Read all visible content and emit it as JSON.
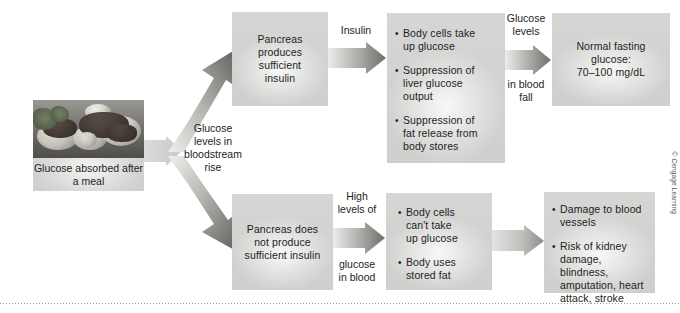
{
  "figure": {
    "credit": "© Cengage Learning",
    "palette": {
      "box_fill": "#d2d2d0",
      "arrow_dark": "#6f6f6d",
      "arrow_light": "#e8e8e6",
      "text": "#1d1d1d",
      "page_background": "#ffffff",
      "rule": "#9a9a98"
    }
  },
  "start": {
    "photo_alt": "plate-of-food-photo",
    "caption": "Glucose absorbed\nafter a meal"
  },
  "connectors": {
    "start_to_branch": {
      "name": "glucose-rise-arrow",
      "label": "Glucose\nlevels in\nbloodstream\nrise"
    },
    "branch_up": {
      "name": "branch-up-arrow",
      "label": ""
    },
    "branch_down": {
      "name": "branch-down-arrow",
      "label": ""
    },
    "top_1": {
      "name": "insulin-arrow",
      "label": "Insulin"
    },
    "top_2": {
      "name": "glucose-levels-fall-arrow",
      "label_above": "Glucose\nlevels",
      "label_below": "in blood\nfall"
    },
    "bottom_1": {
      "name": "high-glucose-arrow",
      "label_above": "High\nlevels of",
      "label_below": "glucose\nin blood"
    },
    "bottom_2": {
      "name": "outcome-arrow",
      "label": ""
    }
  },
  "top_path": {
    "box1": {
      "name": "pancreas-produces-insulin-box",
      "text": "Pancreas\nproduces\nsufficient\ninsulin"
    },
    "box2": {
      "name": "insulin-effects-box",
      "bullets": [
        "Body cells take\nup glucose",
        "Suppression of\nliver glucose\noutput",
        "Suppression of\nfat release from\nbody stores"
      ]
    },
    "box3": {
      "name": "normal-fasting-glucose-box",
      "text": "Normal fasting\nglucose:\n70–100 mg/dL"
    }
  },
  "bottom_path": {
    "box1": {
      "name": "pancreas-insufficient-insulin-box",
      "text": "Pancreas does\nnot produce\nsufficient insulin"
    },
    "box2": {
      "name": "cells-cannot-take-glucose-box",
      "bullets": [
        "Body cells\ncan't take\nup glucose",
        "Body uses\nstored fat"
      ]
    },
    "box3": {
      "name": "complications-box",
      "bullets": [
        "Damage to blood\nvessels",
        "Risk of kidney\ndamage, blindness,\namputation, heart\nattack, stroke"
      ]
    }
  }
}
